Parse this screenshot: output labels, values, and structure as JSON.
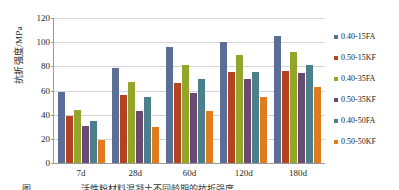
{
  "chart_data": {
    "type": "bar",
    "title": "",
    "xlabel": "",
    "ylabel": "抗折强度/MPa",
    "categories": [
      "7d",
      "28d",
      "60d",
      "120d",
      "180d"
    ],
    "ylim": [
      0,
      120
    ],
    "yticks": [
      0,
      20,
      40,
      60,
      80,
      100,
      120
    ],
    "grid": true,
    "legend_position": "right",
    "series": [
      {
        "name": "0.40-15FA",
        "color": "#5b6e96",
        "values": [
          58.5,
          78.5,
          96.0,
          100.5,
          105.0
        ]
      },
      {
        "name": "0.50-15KF",
        "color": "#b4441f",
        "values": [
          39.0,
          56.0,
          66.0,
          75.0,
          76.0
        ]
      },
      {
        "name": "0.40-35FA",
        "color": "#93a52b",
        "values": [
          43.5,
          67.0,
          81.5,
          89.0,
          91.5
        ]
      },
      {
        "name": "0.50-35KF",
        "color": "#6a4a72",
        "values": [
          30.5,
          43.0,
          58.0,
          69.5,
          74.5
        ]
      },
      {
        "name": "0.40-50FA",
        "color": "#4b7f8c",
        "values": [
          34.5,
          55.0,
          69.5,
          75.0,
          81.0
        ]
      },
      {
        "name": "0.50-50KF",
        "color": "#df7c1e",
        "values": [
          19.0,
          30.0,
          43.0,
          55.0,
          62.5
        ]
      }
    ]
  },
  "caption": {
    "text": "图                       活性粉材料混凝土不同龄期的抗折强度"
  }
}
